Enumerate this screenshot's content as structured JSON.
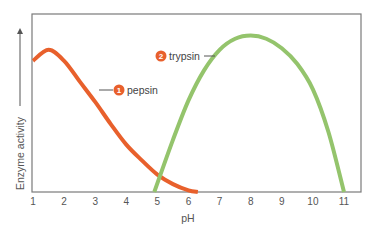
{
  "chart_data": {
    "type": "line",
    "title": "",
    "xlabel": "pH",
    "ylabel": "Enzyme activity",
    "xlim": [
      1,
      11.5
    ],
    "ylim": [
      0,
      1
    ],
    "x_ticks": [
      "1",
      "2",
      "3",
      "4",
      "5",
      "6",
      "7",
      "8",
      "9",
      "10",
      "11"
    ],
    "grid": false,
    "legend_position": "inline labels",
    "series": [
      {
        "name": "pepsin",
        "number": "1",
        "color": "#e8602c",
        "x": [
          1.0,
          1.5,
          2.0,
          2.5,
          3.0,
          3.5,
          4.0,
          4.5,
          5.0,
          5.5,
          6.0,
          6.3
        ],
        "y": [
          0.83,
          0.9,
          0.83,
          0.7,
          0.57,
          0.43,
          0.3,
          0.2,
          0.11,
          0.05,
          0.01,
          0.0
        ]
      },
      {
        "name": "trypsin",
        "number": "2",
        "color": "#94c46c",
        "x": [
          4.9,
          5.5,
          6.0,
          6.5,
          7.0,
          7.5,
          8.0,
          8.5,
          9.0,
          9.5,
          10.0,
          10.5,
          11.0
        ],
        "y": [
          0.0,
          0.33,
          0.58,
          0.77,
          0.9,
          0.97,
          0.99,
          0.97,
          0.91,
          0.81,
          0.65,
          0.38,
          0.0
        ]
      }
    ],
    "annotations": [
      {
        "label": "pepsin",
        "badge": "1"
      },
      {
        "label": "trypsin",
        "badge": "2"
      }
    ]
  }
}
